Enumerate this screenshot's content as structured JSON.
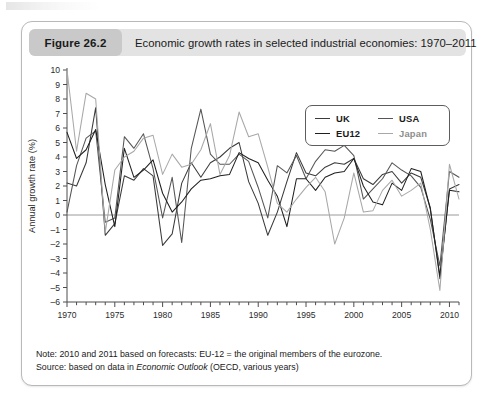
{
  "header": {
    "badge_label": "Figure 26.2",
    "title": "Economic growth rates in selected industrial economies: 1970–2011"
  },
  "legend": {
    "items": [
      {
        "label": "UK",
        "color": "#3a3a3a"
      },
      {
        "label": "USA",
        "color": "#555555"
      },
      {
        "label": "EU12",
        "color": "#1f1f1f"
      },
      {
        "label": "Japan",
        "color": "#a8a8a8"
      }
    ]
  },
  "footer": {
    "note_prefix": "Note: 2010 and 2011 based on forecasts: EU-12 = the original members of the eurozone.",
    "source_prefix": "Source: based on data in ",
    "source_italic": "Economic Outlook",
    "source_suffix": " (OECD, various years)"
  },
  "chart_data": {
    "type": "line",
    "title": "Economic growth rates in selected industrial economies: 1970–2011",
    "xlabel": "",
    "ylabel": "Annual growth rate (%)",
    "xlim": [
      1970,
      2011
    ],
    "ylim": [
      -6,
      10
    ],
    "ytick_step": 1,
    "yticks": [
      10,
      9,
      8,
      7,
      6,
      5,
      4,
      3,
      2,
      1,
      0,
      -1,
      -2,
      -3,
      -4,
      -5,
      -6
    ],
    "xticks_labeled": [
      1970,
      1975,
      1980,
      1985,
      1990,
      1995,
      2000,
      2005,
      2010
    ],
    "xtick_minor_step": 1,
    "grid": false,
    "zero_line": true,
    "legend_position": "top-right",
    "x": [
      1970,
      1971,
      1972,
      1973,
      1974,
      1975,
      1976,
      1977,
      1978,
      1979,
      1980,
      1981,
      1982,
      1983,
      1984,
      1985,
      1986,
      1987,
      1988,
      1989,
      1990,
      1991,
      1992,
      1993,
      1994,
      1995,
      1996,
      1997,
      1998,
      1999,
      2000,
      2001,
      2002,
      2003,
      2004,
      2005,
      2006,
      2007,
      2008,
      2009,
      2010,
      2011
    ],
    "series": [
      {
        "name": "UK",
        "color": "#3a3a3a",
        "values": [
          2.2,
          2.0,
          3.6,
          7.4,
          -1.4,
          -0.6,
          2.7,
          2.4,
          3.2,
          2.7,
          -2.1,
          -1.3,
          2.2,
          3.6,
          2.6,
          3.6,
          4.0,
          4.6,
          5.0,
          2.3,
          0.8,
          -1.4,
          0.2,
          2.3,
          4.3,
          2.9,
          2.7,
          3.3,
          3.6,
          3.5,
          3.9,
          2.5,
          2.1,
          2.8,
          3.0,
          2.2,
          2.9,
          2.6,
          0.5,
          -4.4,
          1.8,
          2.1
        ]
      },
      {
        "name": "USA",
        "color": "#555555",
        "values": [
          0.2,
          3.4,
          5.3,
          5.8,
          -0.5,
          -0.2,
          5.4,
          4.6,
          5.6,
          3.2,
          -0.2,
          2.6,
          -1.9,
          4.6,
          7.3,
          4.2,
          3.5,
          3.5,
          4.2,
          3.7,
          1.9,
          -0.2,
          3.4,
          2.9,
          4.1,
          2.5,
          3.7,
          4.5,
          4.4,
          4.8,
          4.1,
          1.1,
          1.8,
          2.5,
          3.6,
          3.1,
          2.7,
          1.9,
          -0.3,
          -3.5,
          3.0,
          2.6
        ]
      },
      {
        "name": "EU12",
        "color": "#1f1f1f",
        "values": [
          5.7,
          3.9,
          4.5,
          5.9,
          2.1,
          -0.8,
          4.6,
          2.6,
          3.1,
          3.8,
          1.5,
          0.2,
          0.9,
          1.8,
          2.4,
          2.5,
          2.7,
          2.8,
          4.3,
          3.9,
          3.6,
          2.4,
          1.3,
          -0.8,
          2.5,
          2.5,
          1.7,
          2.6,
          2.9,
          3.0,
          3.9,
          2.0,
          0.9,
          0.7,
          2.2,
          1.7,
          3.2,
          3.0,
          0.4,
          -4.2,
          1.7,
          1.6
        ]
      },
      {
        "name": "Japan",
        "color": "#a8a8a8",
        "values": [
          10.0,
          4.4,
          8.4,
          8.0,
          -1.2,
          3.1,
          4.0,
          4.4,
          5.3,
          5.5,
          2.8,
          4.2,
          3.3,
          3.5,
          4.5,
          6.3,
          2.8,
          4.1,
          7.1,
          5.4,
          5.6,
          3.3,
          0.8,
          0.2,
          1.1,
          1.9,
          2.6,
          1.6,
          -2.0,
          -0.2,
          2.9,
          0.2,
          0.3,
          1.7,
          2.4,
          1.3,
          1.7,
          2.2,
          -1.0,
          -5.2,
          3.5,
          1.1
        ]
      }
    ]
  }
}
